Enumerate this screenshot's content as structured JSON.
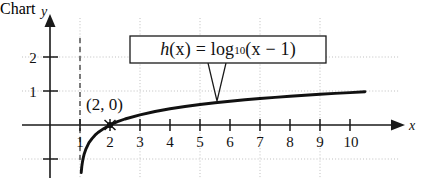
{
  "chart_data": {
    "type": "line",
    "title": "",
    "subtitle": "",
    "xlabel": "x",
    "ylabel": "y",
    "function_expression": "h(x) = log10(x - 1)",
    "function_label_parts": {
      "name": "h",
      "argument": "(x)",
      "equals": "=",
      "log": "log",
      "base": "10",
      "body": "(x − 1)"
    },
    "annotations": [
      {
        "name": "x-intercept",
        "label": "(2, 0)",
        "x": 2,
        "y": 0,
        "marker": "dot"
      },
      {
        "name": "vertical-asymptote",
        "label": "x = 1",
        "x": 1,
        "style": "dashed"
      }
    ],
    "xlim": [
      -0.2,
      11.3
    ],
    "ylim": [
      -1.7,
      2.7
    ],
    "xticks": [
      1,
      2,
      3,
      4,
      5,
      6,
      7,
      8,
      9,
      10
    ],
    "xtick_labels": [
      "1",
      "2",
      "3",
      "4",
      "5",
      "6",
      "7",
      "8",
      "9",
      "10"
    ],
    "yticks": [
      -1,
      1,
      2
    ],
    "ytick_labels": [
      "",
      "1",
      "2"
    ],
    "gridlines": {
      "x": [
        1,
        3,
        5,
        7,
        9
      ],
      "y": [
        -1,
        1,
        2
      ],
      "style": "dotted"
    },
    "grid": true,
    "legend": "none",
    "axis_arrows": [
      "x-positive",
      "y-positive"
    ],
    "series": [
      {
        "name": "h(x) = log10(x - 1)",
        "color": "#111111",
        "x": [
          1.04,
          1.06,
          1.08,
          1.1,
          1.14,
          1.2,
          1.3,
          1.4,
          1.5,
          1.6,
          1.8,
          2.0,
          2.25,
          2.5,
          3.0,
          3.5,
          4.0,
          4.5,
          5.0,
          5.5,
          6.0,
          6.5,
          7.0,
          7.5,
          8.0,
          8.5,
          9.0,
          9.5,
          10.0,
          10.5
        ],
        "y": [
          -1.4,
          -1.22,
          -1.1,
          -1.0,
          -0.85,
          -0.7,
          -0.52,
          -0.4,
          -0.3,
          -0.22,
          -0.1,
          0.0,
          0.097,
          0.176,
          0.301,
          0.398,
          0.477,
          0.544,
          0.602,
          0.653,
          0.699,
          0.74,
          0.778,
          0.813,
          0.845,
          0.875,
          0.903,
          0.929,
          0.954,
          0.978
        ]
      }
    ]
  },
  "labels": {
    "x_axis_name": "x",
    "y_axis_name": "y",
    "point_label": "(2, 0)"
  },
  "colors": {
    "curve": "#111111",
    "axis": "#1a1a1a",
    "grid": "#b8b8b8",
    "asymptote": "#3a3a3a",
    "background": "#ffffff",
    "box_border": "#1a1a1a"
  }
}
